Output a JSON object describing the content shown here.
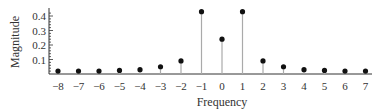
{
  "chart_data": {
    "type": "stem",
    "title": "",
    "xlabel": "Frequency",
    "ylabel": "Magnitude",
    "x": [
      -8,
      -7,
      -6,
      -5,
      -4,
      -3,
      -2,
      -1,
      0,
      1,
      2,
      3,
      4,
      5,
      6,
      7
    ],
    "values": [
      0.02,
      0.02,
      0.02,
      0.025,
      0.03,
      0.05,
      0.09,
      0.43,
      0.24,
      0.43,
      0.09,
      0.05,
      0.03,
      0.025,
      0.02,
      0.02
    ],
    "x_ticks": [
      "-8",
      "-7",
      "-6",
      "-5",
      "-4",
      "-3",
      "-2",
      "-1",
      "0",
      "1",
      "2",
      "3",
      "4",
      "5",
      "6",
      "7"
    ],
    "y_ticks": [
      "0.1",
      "0.2",
      "0.3",
      "0.4"
    ],
    "ylim": [
      0,
      0.45
    ],
    "xlim": [
      -8.5,
      7.5
    ],
    "grid": false,
    "legend": null,
    "colors": {
      "stem": "#aaaaaa",
      "marker": "#111111",
      "axis": "#333333"
    }
  }
}
